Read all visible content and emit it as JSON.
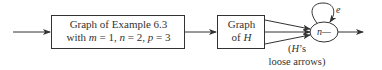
{
  "diagram": {
    "box1": {
      "line1": "Graph of Example 6.3",
      "line2_prefix": "with ",
      "m_var": "m",
      "m_eq": " = 1, ",
      "n_var": "n",
      "n_eq": " = 2, ",
      "p_var": "p",
      "p_eq": " = 3"
    },
    "box2": {
      "line1": "Graph",
      "line2_prefix": "of ",
      "line2_var": "H"
    },
    "node": {
      "label": "n—"
    },
    "loop_label": "e",
    "loose_arrows_note": {
      "line1_open": "(",
      "line1_var": "H",
      "line1_rest": "’s",
      "line2": "loose arrows)"
    },
    "colors": {
      "stroke": "#333333",
      "background": "#ffffff"
    }
  }
}
